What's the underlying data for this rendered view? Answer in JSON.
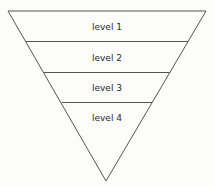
{
  "diagram": {
    "type": "inverted-pyramid",
    "levels": [
      {
        "label": "level 1"
      },
      {
        "label": "level 2"
      },
      {
        "label": "level 3"
      },
      {
        "label": "level 4"
      }
    ],
    "colors": {
      "stroke": "#555555",
      "background": "#fcfcfa",
      "text": "#2a2a2a"
    }
  }
}
